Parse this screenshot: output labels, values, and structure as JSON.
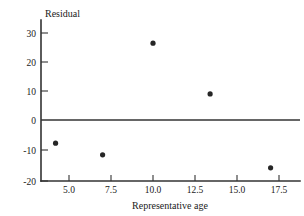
{
  "chart_data": {
    "type": "scatter",
    "title": "",
    "xlabel": "Representative age",
    "ylabel": "Residual",
    "xlim": [
      3.3,
      18.2
    ],
    "ylim": [
      -21.5,
      32.5
    ],
    "xticks": [
      5.0,
      7.5,
      10.0,
      12.5,
      15.0,
      17.5
    ],
    "xtick_labels": [
      "5.0",
      "7.5",
      "10.0",
      "12.5",
      "15.0",
      "17.5"
    ],
    "yticks": [
      30,
      20,
      10,
      0,
      -10,
      -20
    ],
    "ytick_labels": [
      "30",
      "20",
      "10",
      "0",
      "-10",
      "-20"
    ],
    "grid": false,
    "legend": null,
    "zero_reference_line": 0,
    "points": [
      {
        "x": 4.2,
        "y": -8
      },
      {
        "x": 7.0,
        "y": -12
      },
      {
        "x": 10.0,
        "y": 26.5
      },
      {
        "x": 13.4,
        "y": 9
      },
      {
        "x": 17.0,
        "y": -16.5
      }
    ],
    "marker": "filled-circle",
    "marker_color": "#262626",
    "axis_color": "#333333"
  }
}
